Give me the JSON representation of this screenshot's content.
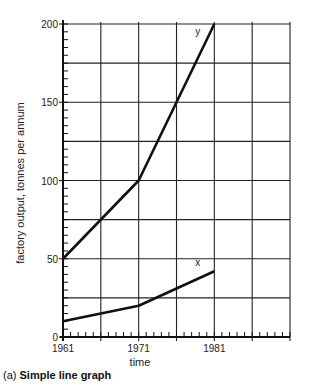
{
  "chart_data": {
    "type": "line",
    "title": "",
    "caption_prefix": "(a)",
    "caption_title": "Simple line graph",
    "xlabel": "time",
    "ylabel": "factory output, tonnes per annum",
    "x_tick_labels": [
      "1961",
      "1971",
      "1981"
    ],
    "y_tick_labels": [
      "0",
      "50",
      "100",
      "150",
      "200"
    ],
    "xlim": [
      1961,
      1991
    ],
    "ylim": [
      0,
      200
    ],
    "grid": true,
    "grid_x_step": 5,
    "grid_y_step": 25,
    "x": [
      1961,
      1966,
      1971,
      1976,
      1981
    ],
    "series": [
      {
        "name": "y",
        "x": [
          1961,
          1971,
          1981
        ],
        "values": [
          50,
          100,
          200
        ]
      },
      {
        "name": "x",
        "x": [
          1961,
          1971,
          1981
        ],
        "values": [
          10,
          20,
          42
        ]
      }
    ],
    "legend": "inline labels at line ends"
  },
  "colors": {
    "line": "#111111",
    "grid": "#222222",
    "background": "#ffffff"
  }
}
